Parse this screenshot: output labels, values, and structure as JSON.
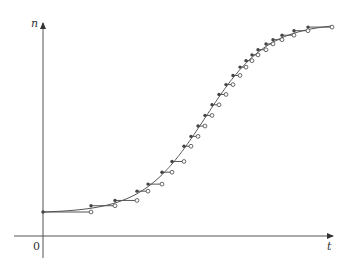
{
  "figure": {
    "y_axis_label": "n",
    "x_axis_label": "t",
    "origin_label": "0",
    "colors": {
      "axis": "#555555",
      "curve": "#555555",
      "dot": "#444444"
    }
  },
  "chart_data": {
    "type": "line",
    "title": "",
    "xlabel": "t",
    "ylabel": "n",
    "grid": false,
    "series": [
      {
        "name": "smooth curve",
        "kind": "logistic"
      },
      {
        "name": "step function",
        "kind": "step",
        "step_x_px": [
          43,
          91,
          115,
          137,
          148,
          162,
          172,
          184,
          191,
          198,
          205,
          212,
          219,
          226,
          233,
          240,
          246,
          252,
          258,
          266,
          273,
          282,
          294,
          308,
          332
        ]
      }
    ]
  }
}
